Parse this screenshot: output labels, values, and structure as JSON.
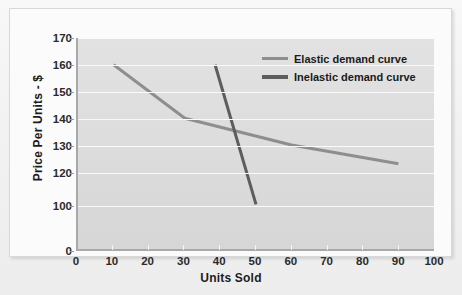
{
  "chart_data": {
    "type": "line",
    "title": "",
    "xlabel": "Units Sold",
    "ylabel": "Price Per Units - $",
    "xlim": [
      0,
      100
    ],
    "ylim": [
      0,
      170
    ],
    "grid": true,
    "legend_position": "top-right",
    "x_ticks": [
      "0",
      "10",
      "20",
      "30",
      "40",
      "50",
      "60",
      "70",
      "80",
      "90",
      "100"
    ],
    "y_ticks": [
      "0",
      "100",
      "120",
      "130",
      "140",
      "150",
      "160",
      "170"
    ],
    "series": [
      {
        "name": "Elastic demand curve",
        "color": "#8e8e8e",
        "width": 3,
        "points": [
          {
            "x": 10,
            "y": 160
          },
          {
            "x": 30,
            "y": 140
          },
          {
            "x": 60,
            "y": 130
          },
          {
            "x": 90,
            "y": 123
          }
        ]
      },
      {
        "name": "Inelastic demand curve",
        "color": "#5d5d5d",
        "width": 3,
        "points": [
          {
            "x": 38.5,
            "y": 160
          },
          {
            "x": 50,
            "y": 100
          }
        ]
      }
    ]
  },
  "legend": {
    "items": [
      {
        "label": "Elastic demand curve"
      },
      {
        "label": "Inelastic demand curve"
      }
    ]
  },
  "axes": {
    "x_title": "Units Sold",
    "y_title": "Price Per Units - $"
  },
  "colors": {
    "plot_background": "#dcdcdc",
    "card_background": "#fbfbfb",
    "gridline": "#fafafa",
    "axis_line": "#a9a9a9",
    "elastic_line": "#8e8e8e",
    "inelastic_line": "#5d5d5d",
    "text": "#1c1c1c"
  }
}
